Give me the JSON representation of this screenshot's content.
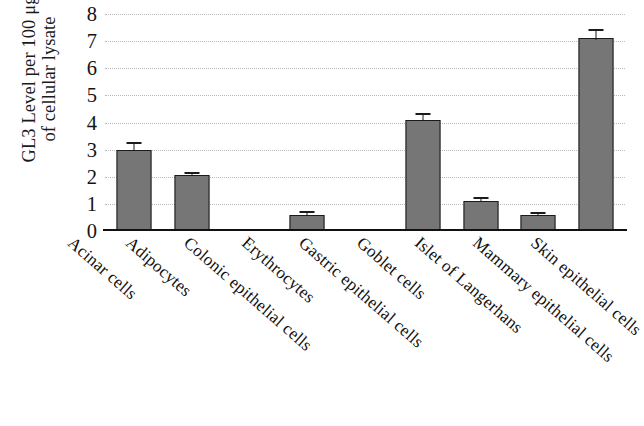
{
  "chart_data": {
    "type": "bar",
    "title": "",
    "xlabel": "",
    "ylabel_lines": [
      "GL3 Level per 100 μg",
      "of cellular lysate"
    ],
    "ylabel": "GL3 Level per 100 μg of cellular lysate",
    "ylim": [
      0,
      8
    ],
    "ytick_labels": [
      "8",
      "7",
      "6",
      "5",
      "4",
      "3",
      "2",
      "1",
      "0"
    ],
    "yticks": [
      8,
      7,
      6,
      5,
      4,
      3,
      2,
      1,
      0
    ],
    "grid": true,
    "grid_axis": "y",
    "legend": "none",
    "bar_color": "#767676",
    "bar_edge_color": "#1b1b1b",
    "categories": [
      "Acinar cells",
      "Adipocytes",
      "Colonic epithelial cells",
      "Erythrocytes",
      "Gastric epithelial cells",
      "Goblet cells",
      "Islet of Langerhans",
      "Mammary epithelial cells",
      "Skin epithelial cells"
    ],
    "values": [
      3.0,
      2.05,
      0.0,
      0.6,
      0.0,
      4.1,
      1.1,
      0.6,
      7.1
    ],
    "errors": [
      0.2,
      0.07,
      0.0,
      0.05,
      0.0,
      0.17,
      0.07,
      0.04,
      0.28
    ],
    "bars": [
      {
        "category": "Acinar cells",
        "value": 3.0,
        "error": 0.2
      },
      {
        "category": "Adipocytes",
        "value": 2.05,
        "error": 0.07
      },
      {
        "category": "Colonic epithelial cells",
        "value": 0.0,
        "error": 0.0
      },
      {
        "category": "Erythrocytes",
        "value": 0.6,
        "error": 0.05
      },
      {
        "category": "Gastric epithelial cells",
        "value": 0.0,
        "error": 0.0
      },
      {
        "category": "Goblet cells",
        "value": 4.1,
        "error": 0.17
      },
      {
        "category": "Islet of Langerhans",
        "value": 1.1,
        "error": 0.07
      },
      {
        "category": "Mammary epithelial cells",
        "value": 0.6,
        "error": 0.04
      },
      {
        "category": "Skin epithelial cells",
        "value": 7.1,
        "error": 0.28
      }
    ]
  }
}
